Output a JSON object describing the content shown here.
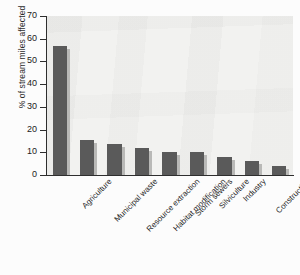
{
  "chart_data": {
    "type": "bar",
    "title": "",
    "xlabel": "",
    "ylabel": "% of stream miles affected",
    "ylim": [
      0,
      70
    ],
    "yticks": [
      0,
      10,
      20,
      30,
      40,
      50,
      60,
      70
    ],
    "grid": false,
    "legend": null,
    "bar_color": "#5a5a5a",
    "plot_background": "#f2f2f0",
    "categories": [
      "Agriculture",
      "Municipal waste",
      "Resource extraction",
      "Habitat modification",
      "Storm sewers",
      "Silviculture",
      "Industry",
      "Construction",
      "Land waste disposal"
    ],
    "values": [
      57,
      15.5,
      13.5,
      12,
      10,
      10,
      8,
      6,
      4
    ]
  }
}
